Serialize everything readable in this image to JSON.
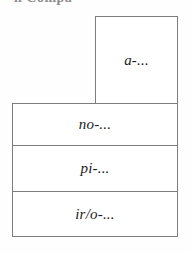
{
  "figure": {
    "header_fragment": "n Compa",
    "boxes": {
      "top_right": {
        "label": "a-...",
        "name": "a-block"
      },
      "stack": [
        {
          "label": "no-...",
          "name": "no-block"
        },
        {
          "label": "pi-...",
          "name": "pi-block"
        },
        {
          "label": "ir/o-...",
          "name": "iro-block"
        }
      ]
    },
    "colors": {
      "background": "#fefefe",
      "box_fill": "#ffffff",
      "stroke": "#7d7d7d",
      "text": "#1c1c1c",
      "header_text": "#8d8d8d"
    }
  }
}
